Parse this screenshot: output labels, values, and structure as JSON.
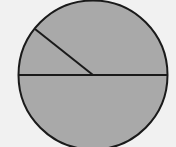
{
  "diagram": {
    "type": "circle-divided",
    "description": "Gray-filled circle divided by a horizontal diameter and one radius drawn from the center toward the upper-left",
    "background_color": "#f1f1f1",
    "fill_color": "#a9a9a9",
    "stroke_color": "#1a1a1a",
    "circle": {
      "cx": 93,
      "cy": 75,
      "r": 75
    },
    "diameter": {
      "x1": 18,
      "y1": 75,
      "x2": 168,
      "y2": 75
    },
    "radius_line": {
      "x1": 93,
      "y1": 75,
      "x2": 35,
      "y2": 29
    },
    "regions": [
      {
        "name": "upper-left sector",
        "approx_angle_deg": 39
      },
      {
        "name": "upper-right sector",
        "approx_angle_deg": 141
      },
      {
        "name": "lower half",
        "approx_angle_deg": 180
      }
    ]
  }
}
